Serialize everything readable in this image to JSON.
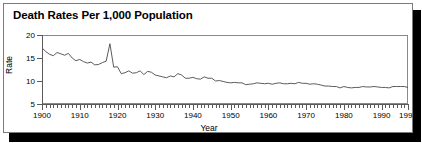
{
  "figure": {
    "title": "Death Rates Per 1,000 Population",
    "frame_color": "#7b7b7b",
    "shadow_color": "#000000",
    "line_color": "#4a4a4a"
  },
  "chart_data": {
    "type": "line",
    "title": "Death Rates Per 1,000 Population",
    "xlabel": "Year",
    "ylabel": "Rate",
    "xlim": [
      1900,
      1997
    ],
    "ylim": [
      5,
      20
    ],
    "grid": false,
    "legend": null,
    "y_ticks": [
      5,
      10,
      15,
      20
    ],
    "x_ticks": [
      1900,
      1910,
      1920,
      1930,
      1940,
      1950,
      1960,
      1970,
      1980,
      1990,
      1997
    ],
    "x_minor_tick_interval": 1,
    "annotations": [
      {
        "x": 1918,
        "y": 18.1,
        "text": "influenza pandemic spike"
      }
    ],
    "series": [
      {
        "name": "Death rate per 1,000 population",
        "x": [
          1900,
          1901,
          1902,
          1903,
          1904,
          1905,
          1906,
          1907,
          1908,
          1909,
          1910,
          1911,
          1912,
          1913,
          1914,
          1915,
          1916,
          1917,
          1918,
          1919,
          1920,
          1921,
          1922,
          1923,
          1924,
          1925,
          1926,
          1927,
          1928,
          1929,
          1930,
          1931,
          1932,
          1933,
          1934,
          1935,
          1936,
          1937,
          1938,
          1939,
          1940,
          1941,
          1942,
          1943,
          1944,
          1945,
          1946,
          1947,
          1948,
          1949,
          1950,
          1951,
          1952,
          1953,
          1954,
          1955,
          1956,
          1957,
          1958,
          1959,
          1960,
          1961,
          1962,
          1963,
          1964,
          1965,
          1966,
          1967,
          1968,
          1969,
          1970,
          1971,
          1972,
          1973,
          1974,
          1975,
          1976,
          1977,
          1978,
          1979,
          1980,
          1981,
          1982,
          1983,
          1984,
          1985,
          1986,
          1987,
          1988,
          1989,
          1990,
          1991,
          1992,
          1993,
          1994,
          1995,
          1996,
          1997
        ],
        "y": [
          17.2,
          16.4,
          15.8,
          15.5,
          16.2,
          15.9,
          15.6,
          16.0,
          15.0,
          14.4,
          14.7,
          14.2,
          13.9,
          14.1,
          13.5,
          13.6,
          14.0,
          14.3,
          18.1,
          13.0,
          13.1,
          11.6,
          11.8,
          12.2,
          11.7,
          11.8,
          12.2,
          11.4,
          12.1,
          11.9,
          11.3,
          11.1,
          10.9,
          10.7,
          11.1,
          10.9,
          11.6,
          11.3,
          10.6,
          10.6,
          10.8,
          10.5,
          10.4,
          10.9,
          10.6,
          10.6,
          10.0,
          10.1,
          9.9,
          9.7,
          9.6,
          9.7,
          9.6,
          9.6,
          9.2,
          9.3,
          9.4,
          9.6,
          9.5,
          9.4,
          9.5,
          9.3,
          9.5,
          9.6,
          9.4,
          9.4,
          9.5,
          9.4,
          9.7,
          9.5,
          9.5,
          9.3,
          9.4,
          9.3,
          9.1,
          8.9,
          8.9,
          8.8,
          8.8,
          8.5,
          8.8,
          8.6,
          8.5,
          8.6,
          8.6,
          8.8,
          8.7,
          8.7,
          8.8,
          8.7,
          8.6,
          8.6,
          8.5,
          8.8,
          8.8,
          8.8,
          8.8,
          8.6
        ]
      }
    ]
  }
}
